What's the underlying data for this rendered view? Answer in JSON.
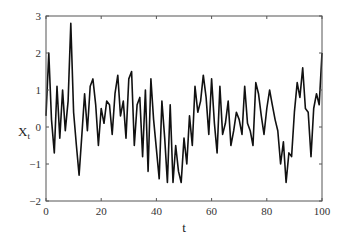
{
  "chart_data": {
    "type": "line",
    "title": "",
    "xlabel": "t",
    "ylabel": "X",
    "ylabel_subscript": "t",
    "xlim": [
      0,
      100
    ],
    "ylim": [
      -2,
      3
    ],
    "xticks": [
      0,
      20,
      40,
      60,
      80,
      100
    ],
    "yticks": [
      -2,
      -1,
      0,
      1,
      2,
      3
    ],
    "xtick_labels": [
      "0",
      "20",
      "40",
      "60",
      "80",
      "100"
    ],
    "ytick_labels": [
      "−2",
      "−1",
      "0",
      "1",
      "2",
      "3"
    ],
    "grid": false,
    "legend": null,
    "line_color": "#111111",
    "series": [
      {
        "name": "X_t",
        "x": [
          0,
          1,
          2,
          3,
          4,
          5,
          6,
          7,
          8,
          9,
          10,
          11,
          12,
          13,
          14,
          15,
          16,
          17,
          18,
          19,
          20,
          21,
          22,
          23,
          24,
          25,
          26,
          27,
          28,
          29,
          30,
          31,
          32,
          33,
          34,
          35,
          36,
          37,
          38,
          39,
          40,
          41,
          42,
          43,
          44,
          45,
          46,
          47,
          48,
          49,
          50,
          51,
          52,
          53,
          54,
          55,
          56,
          57,
          58,
          59,
          60,
          61,
          62,
          63,
          64,
          65,
          66,
          67,
          68,
          69,
          70,
          71,
          72,
          73,
          74,
          75,
          76,
          77,
          78,
          79,
          80,
          81,
          82,
          83,
          84,
          85,
          86,
          87,
          88,
          89,
          90,
          91,
          92,
          93,
          94,
          95,
          96,
          97,
          98,
          99,
          100
        ],
        "values": [
          0.3,
          2.0,
          0.2,
          -0.7,
          1.1,
          -0.3,
          1.0,
          -0.1,
          0.7,
          2.8,
          0.4,
          -0.5,
          -1.3,
          -0.2,
          0.9,
          -0.1,
          1.1,
          1.3,
          0.6,
          -0.5,
          0.5,
          0.1,
          0.7,
          0.6,
          -0.2,
          0.9,
          1.4,
          0.3,
          0.7,
          -0.3,
          1.3,
          1.5,
          -0.5,
          0.6,
          0.8,
          -0.8,
          1.0,
          -1.2,
          1.3,
          0.2,
          -0.6,
          -1.4,
          0.7,
          -0.3,
          -1.5,
          0.6,
          -1.5,
          -0.5,
          -1.2,
          -1.5,
          -0.3,
          -1.0,
          0.3,
          -0.5,
          1.1,
          0.4,
          0.7,
          1.4,
          0.8,
          -0.2,
          1.3,
          0.1,
          -0.7,
          1.1,
          -0.2,
          0.1,
          0.7,
          -0.5,
          -0.1,
          0.4,
          0.2,
          -0.2,
          1.1,
          0.1,
          -0.1,
          -0.5,
          1.2,
          0.9,
          0.3,
          -0.2,
          0.5,
          1.0,
          0.6,
          0.2,
          -0.1,
          -1.0,
          -0.4,
          -1.5,
          -0.7,
          -0.8,
          0.4,
          1.2,
          0.8,
          1.6,
          0.5,
          0.4,
          -0.8,
          0.5,
          0.9,
          0.6,
          2.0
        ],
        "color": "#111111"
      }
    ]
  }
}
